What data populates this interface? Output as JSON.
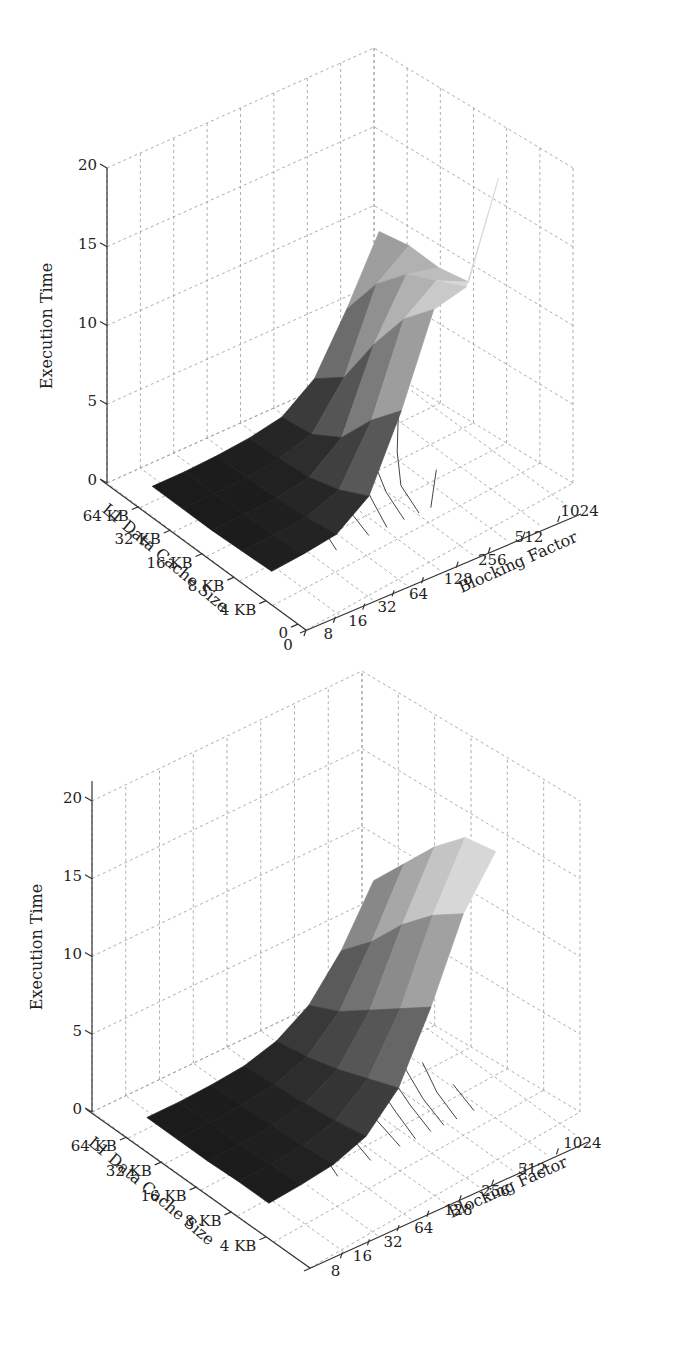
{
  "chart_data": [
    {
      "type": "surface3d",
      "id": "top",
      "title": "",
      "zlabel": "Execution Time",
      "xlabel": "Blocking Factor",
      "ylabel": "L1 Data Cache Size",
      "zlim": [
        0,
        20
      ],
      "z_ticks": [
        "0",
        "5",
        "10",
        "15",
        "20"
      ],
      "x_ticks": [
        "0",
        "8",
        "16",
        "32",
        "64",
        "128",
        "256",
        "512",
        "1024"
      ],
      "y_ticks": [
        "64 KB",
        "32 KB",
        "16 KB",
        "8 KB",
        "4 KB",
        "0"
      ],
      "grid": true,
      "colormap": "gray (dark low, light high)",
      "has_floor_contours": true,
      "x_categories": [
        "8",
        "16",
        "32",
        "64",
        "128",
        "256",
        "512",
        "1024"
      ],
      "y_categories": [
        "64 KB",
        "32 KB",
        "16 KB",
        "8 KB",
        "4 KB"
      ],
      "z_values": [
        [
          0.3,
          0.3,
          0.4,
          0.6,
          1.0,
          2.5,
          6.0,
          10.0
        ],
        [
          0.3,
          0.3,
          0.4,
          0.7,
          1.3,
          4.0,
          9.0,
          10.5
        ],
        [
          0.3,
          0.4,
          0.5,
          0.9,
          2.5,
          7.5,
          11.0,
          10.5
        ],
        [
          0.4,
          0.5,
          0.7,
          1.5,
          5.0,
          10.5,
          12.0,
          11.0
        ],
        [
          0.5,
          0.7,
          1.0,
          2.5,
          7.0,
          12.5,
          13.0,
          19.0
        ]
      ]
    },
    {
      "type": "surface3d",
      "id": "bottom",
      "title": "",
      "zlabel": "Execution Time",
      "xlabel": "Blocking Factor",
      "ylabel": "L1 Data Cache Size",
      "zlim": [
        0,
        20
      ],
      "z_ticks": [
        "0",
        "5",
        "10",
        "15",
        "20"
      ],
      "x_ticks": [
        "8",
        "16",
        "32",
        "64",
        "128",
        "256",
        "512",
        "1024"
      ],
      "y_ticks": [
        "64 KB",
        "32 KB",
        "16 KB",
        "8 KB",
        "4 KB"
      ],
      "grid": true,
      "colormap": "gray (dark low, light high)",
      "has_floor_contours": true,
      "x_categories": [
        "8",
        "16",
        "32",
        "64",
        "128",
        "256",
        "512",
        "1024"
      ],
      "y_categories": [
        "64 KB",
        "32 KB",
        "16 KB",
        "8 KB",
        "4 KB"
      ],
      "z_values": [
        [
          0.3,
          0.3,
          0.4,
          0.6,
          1.2,
          2.5,
          5.0,
          8.5
        ],
        [
          0.3,
          0.4,
          0.5,
          0.8,
          1.6,
          3.5,
          7.0,
          11.0
        ],
        [
          0.3,
          0.4,
          0.6,
          1.0,
          2.2,
          5.0,
          9.5,
          13.5
        ],
        [
          0.4,
          0.5,
          0.7,
          1.3,
          3.0,
          6.5,
          11.5,
          15.5
        ],
        [
          0.4,
          0.6,
          0.9,
          1.7,
          3.8,
          8.0,
          13.0,
          16.0
        ]
      ]
    }
  ]
}
